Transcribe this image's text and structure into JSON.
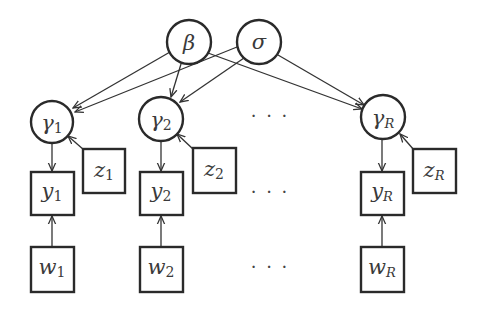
{
  "diagram": {
    "type": "graphical-model",
    "colors": {
      "stroke": "#2a2a2a",
      "edge": "#333333",
      "text": "#3a3a3a",
      "background": "#ffffff"
    },
    "top_nodes": [
      {
        "id": "beta",
        "symbol": "β",
        "shape": "circle"
      },
      {
        "id": "sigma",
        "symbol": "σ",
        "shape": "circle"
      }
    ],
    "columns": [
      {
        "index": "1",
        "gamma": {
          "symbol": "γ",
          "subscript": "1"
        },
        "z": {
          "symbol": "z",
          "subscript": "1"
        },
        "y": {
          "symbol": "y",
          "subscript": "1"
        },
        "w": {
          "symbol": "w",
          "subscript": "1"
        }
      },
      {
        "index": "2",
        "gamma": {
          "symbol": "γ",
          "subscript": "2"
        },
        "z": {
          "symbol": "z",
          "subscript": "2"
        },
        "y": {
          "symbol": "y",
          "subscript": "2"
        },
        "w": {
          "symbol": "w",
          "subscript": "2"
        }
      },
      {
        "index": "R",
        "gamma": {
          "symbol": "γ",
          "subscript": "R"
        },
        "z": {
          "symbol": "z",
          "subscript": "R"
        },
        "y": {
          "symbol": "y",
          "subscript": "R"
        },
        "w": {
          "symbol": "w",
          "subscript": "R"
        }
      }
    ],
    "ellipsis": {
      "row_gamma": "· · ·",
      "row_y": "· · ·",
      "row_w": "· · ·"
    },
    "edges": [
      {
        "from": "β",
        "to": "γ1"
      },
      {
        "from": "σ",
        "to": "γ1"
      },
      {
        "from": "β",
        "to": "γ2"
      },
      {
        "from": "σ",
        "to": "γ2"
      },
      {
        "from": "β",
        "to": "γR"
      },
      {
        "from": "σ",
        "to": "γR"
      },
      {
        "from": "z1",
        "to": "γ1"
      },
      {
        "from": "z2",
        "to": "γ2"
      },
      {
        "from": "zR",
        "to": "γR"
      },
      {
        "from": "γ1",
        "to": "y1"
      },
      {
        "from": "γ2",
        "to": "y2"
      },
      {
        "from": "γR",
        "to": "yR"
      },
      {
        "from": "w1",
        "to": "y1"
      },
      {
        "from": "w2",
        "to": "y2"
      },
      {
        "from": "wR",
        "to": "yR"
      }
    ]
  }
}
